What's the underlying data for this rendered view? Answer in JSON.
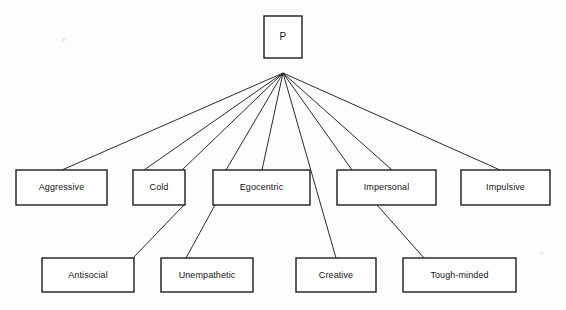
{
  "figure": {
    "type": "hierarchical-tree-diagram",
    "background_color": "#fdfdfc",
    "line_color": "#2b2b2b",
    "box_fill": "#ffffff",
    "box_stroke": "#1c1c1c",
    "caption": ""
  },
  "nodes": {
    "root": {
      "id": "P",
      "label": "P",
      "x": 264,
      "y": 16,
      "width": 38,
      "height": 42,
      "level": 0
    },
    "level1": [
      {
        "id": "aggressive",
        "label": "Aggressive",
        "x": 16,
        "y": 170,
        "width": 91,
        "height": 35,
        "level": 1
      },
      {
        "id": "cold",
        "label": "Cold",
        "x": 133,
        "y": 170,
        "width": 52,
        "height": 35,
        "level": 1
      },
      {
        "id": "egocentric",
        "label": "Egocentric",
        "x": 213,
        "y": 170,
        "width": 97,
        "height": 35,
        "level": 1
      },
      {
        "id": "impersonal",
        "label": "Impersonal",
        "x": 337,
        "y": 170,
        "width": 99,
        "height": 35,
        "level": 1
      },
      {
        "id": "impulsive",
        "label": "Impulsive",
        "x": 461,
        "y": 170,
        "width": 89,
        "height": 35,
        "level": 1
      }
    ],
    "level2": [
      {
        "id": "antisocial",
        "label": "Antisocial",
        "x": 42,
        "y": 258,
        "width": 92,
        "height": 34,
        "level": 2
      },
      {
        "id": "unempathetic",
        "label": "Unempathetic",
        "x": 161,
        "y": 258,
        "width": 92,
        "height": 34,
        "level": 2
      },
      {
        "id": "creative",
        "label": "Creative",
        "x": 296,
        "y": 258,
        "width": 80,
        "height": 34,
        "level": 2
      },
      {
        "id": "toughminded",
        "label": "Tough-minded",
        "x": 403,
        "y": 258,
        "width": 113,
        "height": 34,
        "level": 2
      }
    ]
  },
  "fan_origin": {
    "x": 283,
    "y": 73
  },
  "edges": [
    {
      "from": "P",
      "to": "aggressive",
      "x1": 283,
      "y1": 73,
      "x2": 62,
      "y2": 170
    },
    {
      "from": "P",
      "to": "cold",
      "x1": 283,
      "y1": 73,
      "x2": 144,
      "y2": 170
    },
    {
      "from": "P",
      "to": "cold-right",
      "x1": 283,
      "y1": 73,
      "x2": 182,
      "y2": 170
    },
    {
      "from": "P",
      "to": "egocentric-l",
      "x1": 283,
      "y1": 73,
      "x2": 226,
      "y2": 170
    },
    {
      "from": "P",
      "to": "egocentric-r",
      "x1": 283,
      "y1": 73,
      "x2": 262,
      "y2": 170
    },
    {
      "from": "P",
      "to": "creative",
      "x1": 283,
      "y1": 73,
      "x2": 336,
      "y2": 258
    },
    {
      "from": "P",
      "to": "impersonal-l",
      "x1": 283,
      "y1": 73,
      "x2": 352,
      "y2": 170
    },
    {
      "from": "P",
      "to": "impersonal-r",
      "x1": 283,
      "y1": 73,
      "x2": 392,
      "y2": 170
    },
    {
      "from": "P",
      "to": "impulsive",
      "x1": 283,
      "y1": 73,
      "x2": 500,
      "y2": 170
    },
    {
      "from": "cold",
      "to": "antisocial",
      "x1": 184,
      "y1": 205,
      "x2": 133,
      "y2": 258
    },
    {
      "from": "egocentric",
      "to": "unempathetic",
      "x1": 215,
      "y1": 205,
      "x2": 186,
      "y2": 258
    },
    {
      "from": "impersonal",
      "to": "toughminded",
      "x1": 377,
      "y1": 205,
      "x2": 424,
      "y2": 258
    }
  ]
}
